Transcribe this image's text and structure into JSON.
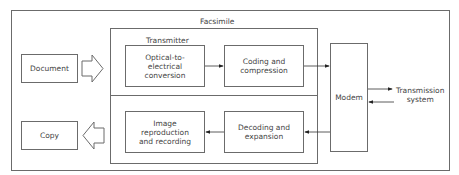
{
  "diagram": {
    "group_label": "Facsimile",
    "transmitter_label": "Transmitter",
    "external": {
      "document": "Document",
      "copy": "Copy",
      "transmission_system": [
        "Transmission",
        "system"
      ]
    },
    "transmitter_blocks": {
      "optical": [
        "Optical-to-",
        "electrical",
        "conversion"
      ],
      "coding": [
        "Coding and",
        "compression"
      ]
    },
    "receiver_blocks": {
      "image": [
        "Image",
        "reproduction",
        "and recording"
      ],
      "decoding": [
        "Decoding and",
        "expansion"
      ]
    },
    "modem": "Modem",
    "colors": {
      "line": "#6b6b6b",
      "text": "#444444",
      "background": "#ffffff"
    }
  }
}
